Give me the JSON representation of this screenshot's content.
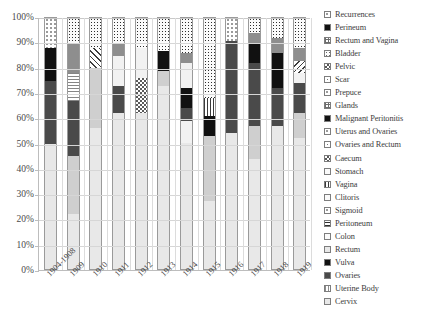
{
  "chart_data": {
    "type": "bar",
    "subtype": "stacked-100-percent",
    "title": "",
    "xlabel": "",
    "ylabel": "",
    "ylim": [
      0,
      100
    ],
    "ytick_labels": [
      "0%",
      "10%",
      "20%",
      "30%",
      "40%",
      "50%",
      "60%",
      "70%",
      "80%",
      "90%",
      "100%"
    ],
    "ytick_values": [
      0,
      10,
      20,
      30,
      40,
      50,
      60,
      70,
      80,
      90,
      100
    ],
    "grid": true,
    "legend_position": "right",
    "categories": [
      "1904-1908",
      "1909",
      "1910",
      "1911",
      "1912",
      "1913",
      "1914",
      "1915",
      "1916",
      "1917",
      "1918",
      "1919"
    ],
    "legend": [
      "Recurrences",
      "Perineum",
      "Rectum and Vagina",
      "Bladder",
      "Pelvic",
      "Scar",
      "Prepuce",
      "Glands",
      "Malignant Peritonitis",
      "Uterus and Ovaries",
      "Ovaries and Rectum",
      "Caecum",
      "Stomach",
      "Vagina",
      "Clitoris",
      "Sigmoid",
      "Peritoneum",
      "Colon",
      "Rectum",
      "Vulva",
      "Ovaries",
      "Uterine Body",
      "Cervix"
    ],
    "legend_patterns": [
      "dots-light",
      "solid-black",
      "grid",
      "dots-mid",
      "checker",
      "sparse",
      "dots-light",
      "grid",
      "solid-black",
      "dots-light",
      "sparse",
      "checker",
      "solid-white",
      "vstripe",
      "solid-white",
      "dots-light",
      "hstripe-dark",
      "solid-white",
      "solid-pale",
      "solid-black",
      "solid-dark",
      "vstripe-light",
      "solid-pale"
    ],
    "series": [
      {
        "name": "Cervix",
        "pattern": "solid-pale",
        "values": [
          50,
          22,
          56,
          62,
          62,
          73,
          50,
          27,
          54,
          44,
          57,
          52
        ]
      },
      {
        "name": "Uterine Body",
        "pattern": "vstripe-light",
        "values": [
          0,
          0,
          0,
          0,
          0,
          0,
          0,
          0,
          0,
          0,
          0,
          0
        ]
      },
      {
        "name": "Ovaries",
        "pattern": "solid-dark",
        "values": [
          25,
          0,
          0,
          0,
          0,
          0,
          0,
          0,
          0,
          0,
          0,
          0
        ]
      },
      {
        "name": "Vulva",
        "pattern": "solid-black",
        "values": [
          13,
          0,
          0,
          0,
          0,
          0,
          0,
          0,
          0,
          0,
          0,
          0
        ]
      },
      {
        "name": "Recurrences",
        "pattern": "dots-light",
        "values": [
          12,
          0,
          0,
          0,
          0,
          0,
          0,
          0,
          0,
          0,
          0,
          0
        ]
      }
    ],
    "bars": [
      {
        "category": "1904-1908",
        "segments": [
          {
            "label": "Cervix",
            "pattern": "solid-pale",
            "value": 50
          },
          {
            "label": "Ovaries",
            "pattern": "solid-dark",
            "value": 25
          },
          {
            "label": "Vulva",
            "pattern": "solid-black",
            "value": 13
          },
          {
            "label": "Recurrences",
            "pattern": "dots-light",
            "value": 12
          }
        ]
      },
      {
        "category": "1909",
        "segments": [
          {
            "label": "Cervix",
            "pattern": "solid-pale",
            "value": 22
          },
          {
            "label": "Colon",
            "pattern": "solid-light",
            "value": 23
          },
          {
            "label": "Ovaries",
            "pattern": "solid-dark",
            "value": 22
          },
          {
            "label": "Peritoneum",
            "pattern": "hstripe",
            "value": 11
          },
          {
            "label": "Glands",
            "pattern": "solid-mid",
            "value": 12
          },
          {
            "label": "Recurrences",
            "pattern": "dots-dark",
            "value": 10
          }
        ]
      },
      {
        "category": "1910",
        "segments": [
          {
            "label": "Cervix",
            "pattern": "solid-pale",
            "value": 56
          },
          {
            "label": "Colon",
            "pattern": "solid-light",
            "value": 24
          },
          {
            "label": "Scar",
            "pattern": "diag",
            "value": 8
          },
          {
            "label": "Recurrences",
            "pattern": "dots-dark",
            "value": 12
          }
        ]
      },
      {
        "category": "1911",
        "segments": [
          {
            "label": "Cervix",
            "pattern": "solid-pale",
            "value": 62
          },
          {
            "label": "Ovaries",
            "pattern": "solid-dark",
            "value": 11
          },
          {
            "label": "Colon",
            "pattern": "solid-vlight",
            "value": 12
          },
          {
            "label": "Glands",
            "pattern": "solid-mid",
            "value": 5
          },
          {
            "label": "Recurrences",
            "pattern": "dots-dark",
            "value": 10
          }
        ]
      },
      {
        "category": "1912",
        "segments": [
          {
            "label": "Cervix",
            "pattern": "solid-pale",
            "value": 62
          },
          {
            "label": "Bladder",
            "pattern": "checker",
            "value": 14
          },
          {
            "label": "Colon",
            "pattern": "solid-vlight",
            "value": 12
          },
          {
            "label": "Recurrences",
            "pattern": "dots-dark",
            "value": 12
          }
        ]
      },
      {
        "category": "1913",
        "segments": [
          {
            "label": "Cervix",
            "pattern": "solid-pale",
            "value": 73
          },
          {
            "label": "Glands",
            "pattern": "solid-light",
            "value": 6
          },
          {
            "label": "Vulva",
            "pattern": "solid-black",
            "value": 8
          },
          {
            "label": "Recurrences",
            "pattern": "dots-dark",
            "value": 13
          }
        ]
      },
      {
        "category": "1914",
        "segments": [
          {
            "label": "Cervix",
            "pattern": "solid-pale",
            "value": 50
          },
          {
            "label": "Colon",
            "pattern": "solid-vlight",
            "value": 9
          },
          {
            "label": "Ovaries",
            "pattern": "solid-dark",
            "value": 5
          },
          {
            "label": "Vulva",
            "pattern": "solid-black",
            "value": 8
          },
          {
            "label": "Colon",
            "pattern": "solid-vlight",
            "value": 10
          },
          {
            "label": "Glands",
            "pattern": "solid-mid",
            "value": 4
          },
          {
            "label": "Recurrences",
            "pattern": "dots-dark",
            "value": 14
          }
        ]
      },
      {
        "category": "1915",
        "segments": [
          {
            "label": "Cervix",
            "pattern": "solid-pale",
            "value": 27
          },
          {
            "label": "Colon",
            "pattern": "solid-light",
            "value": 26
          },
          {
            "label": "Vulva",
            "pattern": "solid-black",
            "value": 8
          },
          {
            "label": "Vagina",
            "pattern": "vstripe",
            "value": 7
          },
          {
            "label": "Recurrences",
            "pattern": "dots-dark",
            "value": 32
          }
        ]
      },
      {
        "category": "1916",
        "segments": [
          {
            "label": "Cervix",
            "pattern": "solid-pale",
            "value": 54
          },
          {
            "label": "Ovaries",
            "pattern": "solid-dark",
            "value": 37
          },
          {
            "label": "Recurrences",
            "pattern": "dots-light",
            "value": 9
          }
        ]
      },
      {
        "category": "1917",
        "segments": [
          {
            "label": "Cervix",
            "pattern": "solid-pale",
            "value": 44
          },
          {
            "label": "Colon",
            "pattern": "solid-light",
            "value": 13
          },
          {
            "label": "Ovaries",
            "pattern": "solid-dark",
            "value": 25
          },
          {
            "label": "Vulva",
            "pattern": "solid-black",
            "value": 8
          },
          {
            "label": "Glands",
            "pattern": "solid-mid",
            "value": 4
          },
          {
            "label": "Recurrences",
            "pattern": "dots-dark",
            "value": 6
          }
        ]
      },
      {
        "category": "1918",
        "segments": [
          {
            "label": "Cervix",
            "pattern": "solid-pale",
            "value": 57
          },
          {
            "label": "Ovaries",
            "pattern": "solid-dark",
            "value": 15
          },
          {
            "label": "Vulva",
            "pattern": "solid-black",
            "value": 14
          },
          {
            "label": "Glands",
            "pattern": "solid-mid",
            "value": 6
          },
          {
            "label": "Recurrences",
            "pattern": "dots-dark",
            "value": 8
          }
        ]
      },
      {
        "category": "1919",
        "segments": [
          {
            "label": "Cervix",
            "pattern": "solid-pale",
            "value": 52
          },
          {
            "label": "Colon",
            "pattern": "solid-light",
            "value": 10
          },
          {
            "label": "Ovaries",
            "pattern": "solid-dark",
            "value": 12
          },
          {
            "label": "Colon",
            "pattern": "solid-vlight",
            "value": 4
          },
          {
            "label": "Scar",
            "pattern": "diag-back",
            "value": 5
          },
          {
            "label": "Glands",
            "pattern": "solid-mid",
            "value": 5
          },
          {
            "label": "Recurrences",
            "pattern": "dots-dark",
            "value": 12
          }
        ]
      }
    ]
  }
}
